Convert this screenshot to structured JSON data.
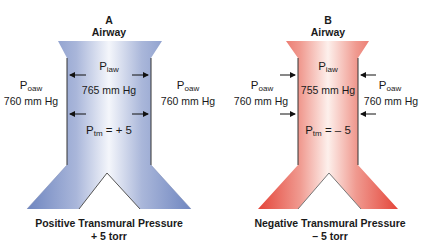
{
  "panels": [
    {
      "letter": "A",
      "title": "Airway",
      "inside": {
        "symbol": "P",
        "subscript": "iaw",
        "value": "765 mm Hg"
      },
      "outside_left": {
        "symbol": "P",
        "subscript": "oaw",
        "value": "760 mm Hg"
      },
      "outside_right": {
        "symbol": "P",
        "subscript": "oaw",
        "value": "760 mm Hg"
      },
      "transmural": {
        "symbol": "P",
        "subscript": "tm",
        "value": " = + 5"
      },
      "arrow_direction": "outward",
      "caption_line1": "Positive Transmural Pressure",
      "caption_line2": "+ 5 torr",
      "color": "#8a9dcb"
    },
    {
      "letter": "B",
      "title": "Airway",
      "inside": {
        "symbol": "P",
        "subscript": "iaw",
        "value": "755 mm Hg"
      },
      "outside_left": {
        "symbol": "P",
        "subscript": "oaw",
        "value": "760 mm Hg"
      },
      "outside_right": {
        "symbol": "P",
        "subscript": "oaw",
        "value": "760 mm Hg"
      },
      "transmural": {
        "symbol": "P",
        "subscript": "tm",
        "value": " = – 5"
      },
      "arrow_direction": "inward",
      "caption_line1": "Negative Transmural Pressure",
      "caption_line2": "– 5 torr",
      "color": "#e8574a"
    }
  ]
}
